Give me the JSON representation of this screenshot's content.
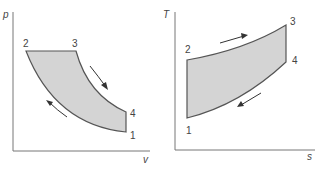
{
  "colors": {
    "fill": "#d4d4d4",
    "stroke": "#555555",
    "axis": "#777777",
    "text": "#444444"
  },
  "pv_diagram": {
    "y_label": "p",
    "x_label": "v",
    "points": [
      {
        "id": "1",
        "label": "1"
      },
      {
        "id": "2",
        "label": "2"
      },
      {
        "id": "3",
        "label": "3"
      },
      {
        "id": "4",
        "label": "4"
      }
    ],
    "processes": [
      {
        "from": "1",
        "to": "2",
        "type": "isentropic compression"
      },
      {
        "from": "2",
        "to": "3",
        "type": "constant pressure heat addition"
      },
      {
        "from": "3",
        "to": "4",
        "type": "isentropic expansion"
      },
      {
        "from": "4",
        "to": "1",
        "type": "constant volume heat rejection"
      }
    ]
  },
  "ts_diagram": {
    "y_label": "T",
    "x_label": "s",
    "points": [
      {
        "id": "1",
        "label": "1"
      },
      {
        "id": "2",
        "label": "2"
      },
      {
        "id": "3",
        "label": "3"
      },
      {
        "id": "4",
        "label": "4"
      }
    ]
  }
}
